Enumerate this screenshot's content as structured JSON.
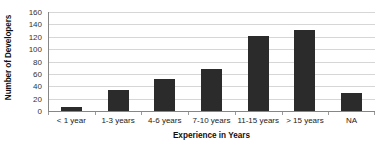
{
  "chart_data": {
    "type": "bar",
    "title": "",
    "xlabel": "Experience in Years",
    "ylabel": "Number of Developers",
    "categories": [
      "< 1 year",
      "1-3 years",
      "4-6 years",
      "7-10 years",
      "11-15 years",
      "> 15 years",
      "NA"
    ],
    "values": [
      7,
      34,
      51,
      68,
      121,
      131,
      29
    ],
    "series": [
      {
        "name": "Number of Developers",
        "values": [
          7,
          34,
          51,
          68,
          121,
          131,
          29
        ]
      }
    ],
    "ylim": [
      0,
      160
    ],
    "ytick_labels": [
      "160",
      "140",
      "120",
      "100",
      "80",
      "60",
      "40",
      "20",
      "0"
    ],
    "ytick_values": [
      160,
      140,
      120,
      100,
      80,
      60,
      40,
      20,
      0
    ],
    "ytick_step": 20,
    "grid": "horizontal",
    "legend": "none",
    "bar_color": "#2b2b2b",
    "gridline_color": "#d6d6d6",
    "axis_color": "#868686",
    "background_color": "#ffffff"
  }
}
